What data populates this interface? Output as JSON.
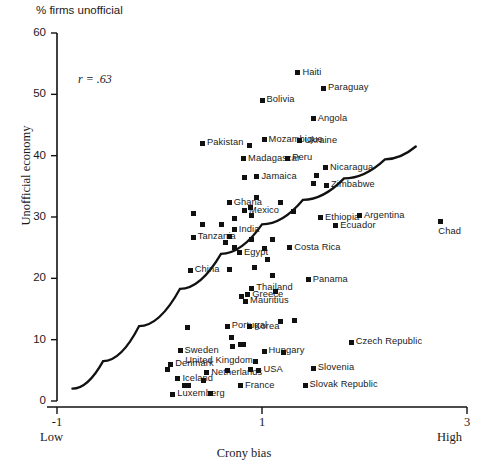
{
  "chart_data": {
    "type": "scatter",
    "title": "% firms unofficial",
    "xlabel": "Crony bias",
    "ylabel": "Unofficial economy",
    "xlim": [
      -1,
      3
    ],
    "ylim": [
      0,
      60
    ],
    "xticks": [
      -1,
      1,
      3
    ],
    "yticks": [
      0,
      10,
      20,
      30,
      40,
      50,
      60
    ],
    "xtick_labels": [
      "-1",
      "1",
      "3"
    ],
    "ytick_labels": [
      "0",
      "10",
      "20",
      "30",
      "40",
      "50",
      "60"
    ],
    "x_axis_low_label": "Low",
    "x_axis_high_label": "High",
    "grid": false,
    "legend": false,
    "annotation": "r = .63",
    "correlation": 0.63,
    "fit_line": {
      "type": "curve",
      "description": "upward-sloping concave fitted curve",
      "points": [
        [
          -0.85,
          2.0
        ],
        [
          -0.55,
          6.5
        ],
        [
          -0.2,
          12.2
        ],
        [
          0.2,
          18.3
        ],
        [
          0.6,
          24.0
        ],
        [
          1.0,
          28.8
        ],
        [
          1.4,
          32.8
        ],
        [
          1.8,
          36.3
        ],
        [
          2.2,
          39.4
        ],
        [
          2.5,
          41.5
        ]
      ]
    },
    "points": [
      {
        "label": "Haiti",
        "x": 1.35,
        "y": 53.5,
        "lpos": "right"
      },
      {
        "label": "Paraguay",
        "x": 1.6,
        "y": 51.0,
        "lpos": "right"
      },
      {
        "label": "Bolivia",
        "x": 1.0,
        "y": 49.0,
        "lpos": "right"
      },
      {
        "label": "Angola",
        "x": 1.5,
        "y": 46.0,
        "lpos": "right"
      },
      {
        "label": "Pakistan",
        "x": 0.42,
        "y": 42.0,
        "lpos": "right"
      },
      {
        "label": "Mozambique",
        "x": 1.02,
        "y": 42.6,
        "lpos": "right"
      },
      {
        "label": "Ukraine",
        "x": 1.37,
        "y": 42.4,
        "lpos": "right"
      },
      {
        "label": "",
        "x": 0.88,
        "y": 41.6,
        "lpos": "none"
      },
      {
        "label": "Madagascar",
        "x": 0.82,
        "y": 39.5,
        "lpos": "right"
      },
      {
        "label": "Peru",
        "x": 1.25,
        "y": 39.6,
        "lpos": "right"
      },
      {
        "label": "Nicaragua",
        "x": 1.62,
        "y": 38.0,
        "lpos": "right"
      },
      {
        "label": "Jamaica",
        "x": 0.95,
        "y": 36.6,
        "lpos": "right"
      },
      {
        "label": "",
        "x": 0.83,
        "y": 36.4,
        "lpos": "none"
      },
      {
        "label": "",
        "x": 1.53,
        "y": 36.8,
        "lpos": "none"
      },
      {
        "label": "",
        "x": 1.5,
        "y": 35.4,
        "lpos": "none"
      },
      {
        "label": "Zimbabwe",
        "x": 1.63,
        "y": 35.2,
        "lpos": "right"
      },
      {
        "label": "Ghana",
        "x": 0.68,
        "y": 32.3,
        "lpos": "right"
      },
      {
        "label": "",
        "x": 0.95,
        "y": 33.1,
        "lpos": "none"
      },
      {
        "label": "Mexico",
        "x": 0.83,
        "y": 31.0,
        "lpos": "right"
      },
      {
        "label": "",
        "x": 0.89,
        "y": 31.6,
        "lpos": "none"
      },
      {
        "label": "",
        "x": 0.9,
        "y": 30.3,
        "lpos": "none"
      },
      {
        "label": "",
        "x": 1.18,
        "y": 32.4,
        "lpos": "none"
      },
      {
        "label": "",
        "x": 1.31,
        "y": 30.9,
        "lpos": "none"
      },
      {
        "label": "Ethiopia",
        "x": 1.57,
        "y": 29.9,
        "lpos": "right"
      },
      {
        "label": "Ecuador",
        "x": 1.72,
        "y": 28.6,
        "lpos": "right"
      },
      {
        "label": "Argentina",
        "x": 1.95,
        "y": 30.2,
        "lpos": "right"
      },
      {
        "label": "Chad",
        "x": 2.74,
        "y": 29.2,
        "lpos": "below"
      },
      {
        "label": "",
        "x": 0.33,
        "y": 30.5,
        "lpos": "none"
      },
      {
        "label": "",
        "x": 0.42,
        "y": 28.8,
        "lpos": "none"
      },
      {
        "label": "",
        "x": 0.6,
        "y": 28.7,
        "lpos": "none"
      },
      {
        "label": "",
        "x": 0.73,
        "y": 29.7,
        "lpos": "none"
      },
      {
        "label": "India",
        "x": 0.73,
        "y": 27.9,
        "lpos": "right"
      },
      {
        "label": "Tanzania",
        "x": 0.33,
        "y": 26.7,
        "lpos": "right"
      },
      {
        "label": "",
        "x": 0.68,
        "y": 26.9,
        "lpos": "none"
      },
      {
        "label": "",
        "x": 0.64,
        "y": 25.9,
        "lpos": "none"
      },
      {
        "label": "",
        "x": 0.9,
        "y": 26.4,
        "lpos": "none"
      },
      {
        "label": "Egypt",
        "x": 0.78,
        "y": 24.2,
        "lpos": "right"
      },
      {
        "label": "",
        "x": 0.73,
        "y": 25.0,
        "lpos": "none"
      },
      {
        "label": "",
        "x": 1.02,
        "y": 24.9,
        "lpos": "none"
      },
      {
        "label": "",
        "x": 1.1,
        "y": 26.3,
        "lpos": "none"
      },
      {
        "label": "China",
        "x": 0.3,
        "y": 21.3,
        "lpos": "right"
      },
      {
        "label": "",
        "x": 0.68,
        "y": 21.5,
        "lpos": "none"
      },
      {
        "label": "",
        "x": 0.93,
        "y": 21.7,
        "lpos": "none"
      },
      {
        "label": "Costa Rica",
        "x": 1.27,
        "y": 25.0,
        "lpos": "right"
      },
      {
        "label": "",
        "x": 1.05,
        "y": 23.1,
        "lpos": "none"
      },
      {
        "label": "",
        "x": 1.1,
        "y": 20.4,
        "lpos": "none"
      },
      {
        "label": "Panama",
        "x": 1.45,
        "y": 19.8,
        "lpos": "right"
      },
      {
        "label": "Thailand",
        "x": 0.9,
        "y": 18.4,
        "lpos": "right"
      },
      {
        "label": "Greece",
        "x": 0.86,
        "y": 17.3,
        "lpos": "right"
      },
      {
        "label": "",
        "x": 0.8,
        "y": 17.0,
        "lpos": "none"
      },
      {
        "label": "Mauritius",
        "x": 0.84,
        "y": 16.3,
        "lpos": "right"
      },
      {
        "label": "",
        "x": 1.13,
        "y": 17.8,
        "lpos": "none"
      },
      {
        "label": "",
        "x": 1.18,
        "y": 13.0,
        "lpos": "none"
      },
      {
        "label": "Portugal",
        "x": 0.66,
        "y": 12.2,
        "lpos": "right"
      },
      {
        "label": "Korea",
        "x": 0.88,
        "y": 12.1,
        "lpos": "right"
      },
      {
        "label": "",
        "x": 0.27,
        "y": 12.0,
        "lpos": "none"
      },
      {
        "label": "",
        "x": 1.32,
        "y": 13.1,
        "lpos": "none"
      },
      {
        "label": "",
        "x": 0.7,
        "y": 10.4,
        "lpos": "none"
      },
      {
        "label": "",
        "x": 0.71,
        "y": 8.9,
        "lpos": "none"
      },
      {
        "label": "",
        "x": 0.79,
        "y": 9.2,
        "lpos": "none"
      },
      {
        "label": "",
        "x": 0.82,
        "y": 9.2,
        "lpos": "none"
      },
      {
        "label": "Hungary",
        "x": 1.02,
        "y": 8.1,
        "lpos": "right"
      },
      {
        "label": "",
        "x": 1.21,
        "y": 7.9,
        "lpos": "none"
      },
      {
        "label": "Czech Republic",
        "x": 1.87,
        "y": 9.6,
        "lpos": "right"
      },
      {
        "label": "Sweden",
        "x": 0.2,
        "y": 8.2,
        "lpos": "right"
      },
      {
        "label": "Denmark",
        "x": 0.11,
        "y": 6.0,
        "lpos": "right"
      },
      {
        "label": "",
        "x": 0.08,
        "y": 5.2,
        "lpos": "none"
      },
      {
        "label": "United Kingdom",
        "x": 0.94,
        "y": 6.5,
        "lpos": "left"
      },
      {
        "label": "USA",
        "x": 0.97,
        "y": 5.0,
        "lpos": "right"
      },
      {
        "label": "",
        "x": 0.89,
        "y": 5.1,
        "lpos": "none"
      },
      {
        "label": "Slovenia",
        "x": 1.5,
        "y": 5.3,
        "lpos": "right"
      },
      {
        "label": "Netherlands",
        "x": 0.46,
        "y": 4.6,
        "lpos": "right"
      },
      {
        "label": "",
        "x": 0.66,
        "y": 4.9,
        "lpos": "none"
      },
      {
        "label": "Iceland",
        "x": 0.18,
        "y": 3.6,
        "lpos": "right"
      },
      {
        "label": "",
        "x": 0.24,
        "y": 2.6,
        "lpos": "none"
      },
      {
        "label": "",
        "x": 0.28,
        "y": 2.5,
        "lpos": "none"
      },
      {
        "label": "",
        "x": 0.43,
        "y": 3.3,
        "lpos": "none"
      },
      {
        "label": "France",
        "x": 0.79,
        "y": 2.5,
        "lpos": "right"
      },
      {
        "label": "Slovak Republic",
        "x": 1.42,
        "y": 2.6,
        "lpos": "right"
      },
      {
        "label": "Luxemberg",
        "x": 0.13,
        "y": 1.1,
        "lpos": "right"
      },
      {
        "label": "",
        "x": 0.5,
        "y": 1.3,
        "lpos": "none"
      }
    ]
  },
  "colors": {
    "axis": "#111111",
    "marker": "#111111",
    "curve": "#111111",
    "background": "#ffffff"
  }
}
